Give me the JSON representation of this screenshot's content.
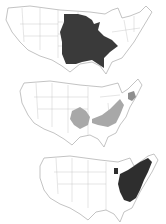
{
  "figure": {
    "panels": [
      {
        "id": "map-top",
        "description": "Contiguous US map with dark shaded region covering central/Midwest and Southeast states",
        "shade_color": "#3a3a3a",
        "shaded_states": [
          "MN",
          "WI",
          "MI",
          "IA",
          "IL",
          "IN",
          "MO",
          "AR",
          "LA",
          "MS",
          "AL",
          "TN",
          "KY",
          "GA",
          "FL-panhandle",
          "SC"
        ]
      },
      {
        "id": "map-middle",
        "description": "Contiguous US map with light gray shaded areas in the south-central region and Appalachian/mid-Atlantic region, plus a small area in New England",
        "shade_color": "#a8a8a8",
        "shaded_states": [
          "OK-east",
          "AR",
          "MO-south",
          "KY",
          "TN-east",
          "WV",
          "VA",
          "NC",
          "PA",
          "NY-east",
          "MA"
        ]
      },
      {
        "id": "map-bottom",
        "description": "Contiguous US map with dark shaded region covering Northeastern and Atlantic states",
        "shade_color": "#2e2e2e",
        "shaded_states": [
          "ME",
          "NH",
          "VT",
          "MA",
          "NY",
          "PA",
          "NJ",
          "OH",
          "WV",
          "VA",
          "NC",
          "MD",
          "DE",
          "SC",
          "MI-part"
        ]
      }
    ],
    "outline_color": "#9a9a9a",
    "background": "#ffffff"
  }
}
